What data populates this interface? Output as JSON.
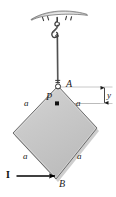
{
  "figure": {
    "background_color": "#ffffff",
    "plate": {
      "fill_color": "#c9c9c9",
      "edge_color": "#555555",
      "shadow_color": "#9a9a9a",
      "shape": "square-rotated-45",
      "vertices": {
        "top": {
          "label": "A",
          "x": 58,
          "y": 86
        },
        "right": {
          "x": 97,
          "y": 128
        },
        "bottom": {
          "label": "B",
          "x": 56,
          "y": 179
        },
        "left": {
          "x": 13,
          "y": 133
        }
      }
    },
    "points": [
      {
        "name": "A",
        "label": "A",
        "type": "pin-support",
        "marker": "open-circle"
      },
      {
        "name": "P",
        "label": "P",
        "type": "mass-center",
        "marker": "filled-dot"
      },
      {
        "name": "B",
        "label": "B",
        "type": "corner",
        "marker": "none"
      }
    ],
    "side_labels": [
      {
        "label": "a",
        "position": "upper-left"
      },
      {
        "label": "a",
        "position": "upper-right"
      },
      {
        "label": "a",
        "position": "lower-left"
      },
      {
        "label": "a",
        "position": "lower-right"
      }
    ],
    "dimension": {
      "label": "y",
      "orientation": "vertical",
      "from": "A",
      "to": "P",
      "arrow": "double-headed",
      "extension_line_color": "#8a8a8a"
    },
    "force": {
      "label": "I",
      "style": "bold-vector",
      "direction": "rightward",
      "applied_at": "B",
      "arrow_color": "#000000"
    },
    "support": {
      "type": "ceiling-plate-with-hook",
      "plate_fill": "#d8d8d8",
      "plate_edge": "#4a4a4a",
      "hatch_color": "#3a3a3a",
      "cable_color": "#3a3a3a",
      "hook_color": "#444444"
    }
  }
}
